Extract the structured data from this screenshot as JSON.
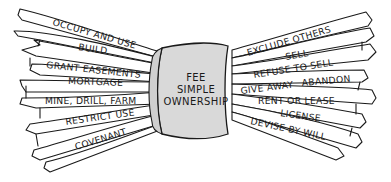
{
  "diagram": {
    "center": {
      "lines": [
        "FEE",
        "SIMPLE",
        "OWNERSHIP"
      ],
      "band_color": "#d9d9d9"
    },
    "left_rights": [
      {
        "label": "OCCUPY AND USE"
      },
      {
        "label": "BUILD"
      },
      {
        "label": "GRANT EASEMENTS"
      },
      {
        "label": "MORTGAGE"
      },
      {
        "label": "MINE, DRILL, FARM"
      },
      {
        "label": "RESTRICT USE"
      },
      {
        "label": "COVENANT"
      }
    ],
    "right_rights": [
      {
        "label": "EXCLUDE OTHERS"
      },
      {
        "label": "SELL"
      },
      {
        "label": "REFUSE TO SELL"
      },
      {
        "label": "GIVE AWAY"
      },
      {
        "label": "ABANDON"
      },
      {
        "label": "RENT OR LEASE"
      },
      {
        "label": "LICENSE"
      },
      {
        "label": "DEVISE BY WILL"
      }
    ],
    "colors": {
      "ink": "#1a1a1a",
      "stick_fill": "#ffffff",
      "band_fill": "#d9d9d9"
    }
  }
}
